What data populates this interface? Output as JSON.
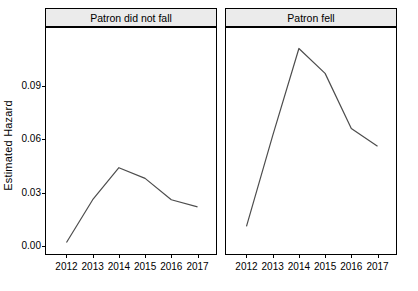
{
  "chart_data": {
    "type": "line",
    "title": "",
    "xlabel": "",
    "ylabel": "Estimated Hazard",
    "x": [
      2012,
      2013,
      2014,
      2015,
      2016,
      2017
    ],
    "xlim": [
      2011.6,
      2017.4
    ],
    "ylim": [
      0.0,
      0.118
    ],
    "yticks": [
      0.0,
      0.03,
      0.06,
      0.09
    ],
    "ytick_labels": [
      "0.00",
      "0.03",
      "0.06",
      "0.09"
    ],
    "xtick_labels": [
      "2012",
      "2013",
      "2014",
      "2015",
      "2016",
      "2017"
    ],
    "grid": false,
    "legend": "none",
    "line_color": "#4d4d4d",
    "panel_strip_color": "#ebebeb",
    "panels": [
      {
        "label": "Patron did not fall",
        "series": [
          {
            "name": "Estimated Hazard",
            "values": [
              0.002,
              0.026,
              0.044,
              0.038,
              0.026,
              0.022
            ]
          }
        ]
      },
      {
        "label": "Patron fell",
        "series": [
          {
            "name": "Estimated Hazard",
            "values": [
              0.011,
              0.062,
              0.111,
              0.097,
              0.066,
              0.056
            ]
          }
        ]
      }
    ]
  },
  "axis": {
    "y_title": "Estimated Hazard"
  }
}
